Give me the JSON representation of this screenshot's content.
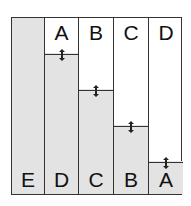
{
  "diagram": {
    "columns": [
      {
        "top_label": "",
        "bottom_label": "E",
        "fill_percent": 100,
        "has_handle": false
      },
      {
        "top_label": "A",
        "bottom_label": "D",
        "fill_percent": 79.5,
        "has_handle": true
      },
      {
        "top_label": "B",
        "bottom_label": "C",
        "fill_percent": 59.5,
        "has_handle": true
      },
      {
        "top_label": "C",
        "bottom_label": "B",
        "fill_percent": 39.5,
        "has_handle": true
      },
      {
        "top_label": "D",
        "bottom_label": "A",
        "fill_percent": 19.5,
        "has_handle": true
      }
    ],
    "colors": {
      "fill": "#e3e3e3",
      "line": "#333333"
    }
  }
}
